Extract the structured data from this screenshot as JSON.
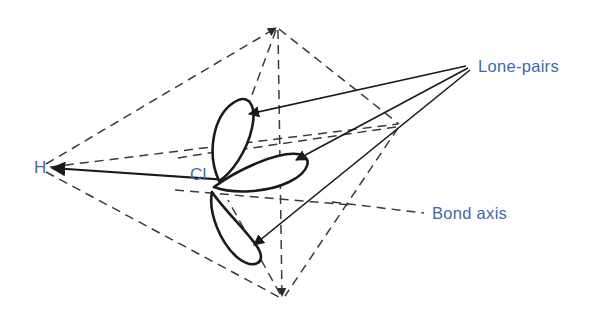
{
  "figure": {
    "name": "hcl-lone-pairs-tetrahedral-diagram",
    "background_color": "#ffffff",
    "label_color": "#3a6ab0",
    "line_color": "#1a1a1a",
    "dashed_color": "#3a3a3a",
    "width": 599,
    "height": 320
  },
  "atoms": [
    {
      "id": "hydrogen",
      "label": "H",
      "x": 34,
      "y": 173,
      "color": "#3a6ab0"
    },
    {
      "id": "chlorine",
      "label": "Cl",
      "x": 196,
      "y": 180,
      "color": "#3a6ab0"
    }
  ],
  "callouts": [
    {
      "id": "lone-pairs",
      "label": "Lone-pairs",
      "x": 478,
      "y": 72,
      "color": "#3a6ab0",
      "leader_origin_x": 468,
      "leader_origin_y": 65
    },
    {
      "id": "bond-axis",
      "label": "Bond axis",
      "x": 432,
      "y": 218,
      "color": "#3a6ab0"
    }
  ],
  "lone_pairs": [
    {
      "id": "lone-pair-upper",
      "description": "upper-left lobe tilted up",
      "tip_x": 218,
      "tip_y": 180,
      "far_x": 240,
      "far_y": 104
    },
    {
      "id": "lone-pair-middle",
      "description": "middle lobe pointing right",
      "tip_x": 214,
      "tip_y": 186,
      "far_x": 302,
      "far_y": 155
    },
    {
      "id": "lone-pair-lower",
      "description": "lower lobe pointing down-right",
      "tip_x": 212,
      "tip_y": 192,
      "far_x": 264,
      "far_y": 252
    }
  ],
  "tetrahedron": {
    "vertices": [
      {
        "id": "vertex-left-h",
        "x": 42,
        "y": 166
      },
      {
        "id": "vertex-top",
        "x": 278,
        "y": 25
      },
      {
        "id": "vertex-right",
        "x": 400,
        "y": 125
      },
      {
        "id": "vertex-bottom",
        "x": 282,
        "y": 300
      }
    ],
    "style": "dashed"
  },
  "bond": {
    "id": "h-cl-bond",
    "from_x": 258,
    "from_y": 182,
    "to_x": 48,
    "to_y": 168,
    "style": "solid-arrow"
  }
}
